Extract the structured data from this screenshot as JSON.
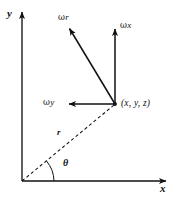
{
  "figure": {
    "background_color": "#ffffff",
    "line_color": "#111111",
    "axes": {
      "y_label": "y",
      "x_label": "x",
      "origin": {
        "x": 22,
        "y": 181
      },
      "y_axis_top": {
        "x": 22,
        "y": 10
      },
      "x_axis_right": {
        "x": 168,
        "y": 181
      }
    },
    "point": {
      "label": "(x, y, z)",
      "coords": {
        "x": 115,
        "y": 104
      }
    },
    "vectors": [
      {
        "name": "omega-r",
        "omega_symbol": "ω",
        "component": "r",
        "from": {
          "x": 115,
          "y": 104
        },
        "to": {
          "x": 68,
          "y": 27
        },
        "label_pos": {
          "x": 60,
          "y": 14
        }
      },
      {
        "name": "omega-x",
        "omega_symbol": "ω",
        "component": "x",
        "from": {
          "x": 115,
          "y": 104
        },
        "to": {
          "x": 115,
          "y": 27
        },
        "label_pos": {
          "x": 120,
          "y": 22
        }
      },
      {
        "name": "omega-y",
        "omega_symbol": "ω",
        "component": "y",
        "from": {
          "x": 115,
          "y": 104
        },
        "to": {
          "x": 67,
          "y": 104
        },
        "label_pos": {
          "x": 44,
          "y": 98
        }
      }
    ],
    "radius_line": {
      "label": "r",
      "style": "dashed",
      "from": {
        "x": 22,
        "y": 181
      },
      "to": {
        "x": 115,
        "y": 104
      },
      "label_pos": {
        "x": 58,
        "y": 129
      }
    },
    "angle": {
      "label": "θ",
      "label_pos": {
        "x": 64,
        "y": 159
      },
      "arc_radius": 32
    }
  }
}
